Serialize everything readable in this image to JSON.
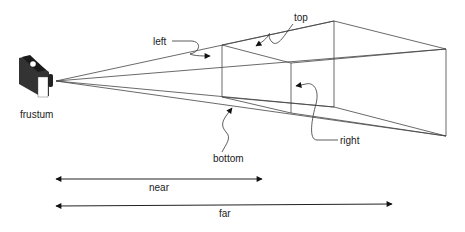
{
  "diagram": {
    "colors": {
      "line": "#444444",
      "arrow": "#111111",
      "camera_body": "#333333",
      "camera_face": "#ffffff",
      "text": "#222222"
    },
    "camera": {
      "icon": "camera-icon",
      "label": "frustum"
    },
    "planes": {
      "near": {
        "top_left": [
          222,
          45
        ],
        "top_right": [
          291,
          63
        ],
        "bottom_left": [
          222,
          97
        ],
        "bottom_right": [
          291,
          113
        ]
      },
      "far": {
        "top_left": [
          334,
          21
        ],
        "top_right": [
          446,
          49
        ],
        "bottom_left": [
          334,
          107
        ],
        "bottom_right": [
          446,
          136
        ]
      },
      "apex": [
        56,
        81
      ]
    },
    "labels": {
      "left": "left",
      "top": "top",
      "right": "right",
      "bottom": "bottom"
    },
    "dimensions": {
      "near": {
        "label": "near",
        "x1": 55,
        "x2": 262,
        "y": 179
      },
      "far": {
        "label": "far",
        "x1": 55,
        "x2": 392,
        "y": 205
      }
    }
  }
}
